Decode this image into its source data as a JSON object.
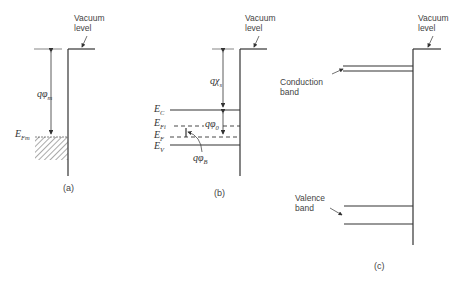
{
  "panels": {
    "a": {
      "caption": "(a)",
      "vacuum_label_line1": "Vacuum",
      "vacuum_label_line2": "level",
      "work_function_label": "qφ",
      "work_function_sub": "m",
      "fermi_label": "E",
      "fermi_sub": "Fm"
    },
    "b": {
      "caption": "(b)",
      "vacuum_label_line1": "Vacuum",
      "vacuum_label_line2": "level",
      "affinity_label": "qχ",
      "affinity_sub": "s",
      "ec_label": "E",
      "ec_sub": "C",
      "efi_label": "E",
      "efi_sub": "Fi",
      "ef_label": "E",
      "ef_sub": "F",
      "ev_label": "E",
      "ev_sub": "V",
      "phi0_label": "qφ",
      "phi0_sub": "0",
      "phib_label": "qφ",
      "phib_sub": "B"
    },
    "c": {
      "caption": "(c)",
      "vacuum_label_line1": "Vacuum",
      "vacuum_label_line2": "level",
      "conduction_label_line1": "Conduction",
      "conduction_label_line2": "band",
      "valence_label_line1": "Valence",
      "valence_label_line2": "band"
    }
  },
  "colors": {
    "line": "#333333",
    "text": "#444444",
    "background": "#ffffff"
  }
}
